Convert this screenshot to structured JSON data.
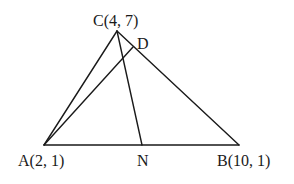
{
  "diagram": {
    "title": "",
    "points": {
      "A": {
        "label": "A(2, 1)",
        "x": 44,
        "y": 145,
        "coords": [
          2,
          1
        ]
      },
      "B": {
        "label": "B(10, 1)",
        "x": 239,
        "y": 145,
        "coords": [
          10,
          1
        ]
      },
      "C": {
        "label": "C(4, 7)",
        "x": 117,
        "y": 31,
        "coords": [
          4,
          7
        ]
      },
      "D": {
        "label": "D",
        "x": 133,
        "y": 47
      },
      "N": {
        "label": "N",
        "x": 142,
        "y": 145
      }
    },
    "segments": [
      {
        "name": "segment-ab",
        "from": "A",
        "to": "B"
      },
      {
        "name": "segment-ac",
        "from": "A",
        "to": "C"
      },
      {
        "name": "segment-cb",
        "from": "C",
        "to": "B"
      },
      {
        "name": "segment-ad",
        "from": "A",
        "to": "D"
      },
      {
        "name": "segment-cn",
        "from": "C",
        "to": "N"
      }
    ],
    "colors": {
      "stroke": "#1a1a1a",
      "background": "#ffffff"
    }
  }
}
